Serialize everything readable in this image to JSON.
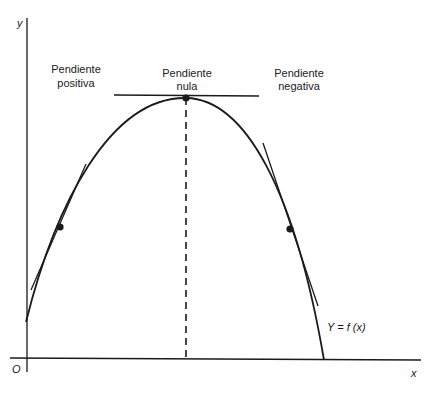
{
  "figure": {
    "axes": {
      "y_label": "y",
      "x_label": "x",
      "origin_label": "O"
    },
    "annotations": {
      "positive_slope": [
        "Pendiente",
        "positiva"
      ],
      "zero_slope": [
        "Pendiente",
        "nula"
      ],
      "negative_slope": [
        "Pendiente",
        "negativa"
      ],
      "function_label": "Y = f (x)"
    },
    "colors": {
      "ink": "#1a1a1a",
      "background": "#ffffff"
    },
    "points": [
      {
        "name": "positive-slope-point",
        "slope": "positive"
      },
      {
        "name": "maximum-point",
        "slope": "zero"
      },
      {
        "name": "negative-slope-point",
        "slope": "negative"
      }
    ]
  }
}
